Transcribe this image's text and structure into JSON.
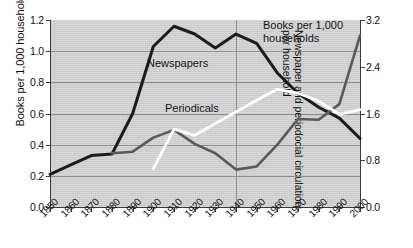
{
  "chart_data": {
    "type": "line",
    "title": "",
    "xlabel": "",
    "ylabel": "Books per 1,000 households",
    "y2label": "Newspaper and periodocial circulation per household",
    "x": [
      1850,
      1860,
      1870,
      1880,
      1890,
      1900,
      1910,
      1920,
      1930,
      1940,
      1950,
      1960,
      1970,
      1980,
      1990,
      2000
    ],
    "xtick_labels": [
      "1850",
      "1860",
      "1870",
      "1880",
      "1890",
      "1900",
      "1910",
      "1920",
      "1930",
      "1940",
      "1950",
      "1960",
      "1970",
      "1980",
      "1990",
      "2000"
    ],
    "ylim": [
      0.0,
      1.2
    ],
    "yticks": [
      0.0,
      0.2,
      0.4,
      0.6,
      0.8,
      1.0,
      1.2
    ],
    "ytick_labels": [
      "0.0",
      "0.2",
      "0.4",
      "0.6",
      "0.8",
      "1.0",
      "1.2"
    ],
    "y2lim": [
      0.0,
      3.2
    ],
    "y2ticks": [
      0.0,
      0.8,
      1.6,
      2.4,
      3.2
    ],
    "y2tick_labels": [
      "0.0",
      "0.8",
      "1.6",
      "2.4",
      "3.2"
    ],
    "grid": true,
    "grid_axis": "both",
    "legend_position": "inline-annotations",
    "plot_background": "#d4d4d4",
    "series": [
      {
        "name": "Newspapers",
        "axis": "right",
        "color": "#1b1b1b",
        "label_text": "Newspapers",
        "x": [
          1850,
          1860,
          1870,
          1880,
          1890,
          1900,
          1910,
          1920,
          1930,
          1940,
          1950,
          1960,
          1970,
          1980,
          1990,
          2000
        ],
        "values_right_axis": [
          0.56,
          0.72,
          0.88,
          0.91,
          1.6,
          2.75,
          3.09,
          2.95,
          2.72,
          2.96,
          2.79,
          2.29,
          1.95,
          1.71,
          1.52,
          1.17
        ],
        "values_left_scale": [
          0.21,
          0.27,
          0.33,
          0.34,
          0.6,
          1.03,
          1.16,
          1.11,
          1.02,
          1.11,
          1.05,
          0.86,
          0.73,
          0.64,
          0.57,
          0.44
        ]
      },
      {
        "name": "Books per 1,000 households",
        "axis": "left",
        "color": "#595959",
        "label_text": "Books per 1,000 households",
        "x": [
          1880,
          1890,
          1900,
          1910,
          1920,
          1930,
          1940,
          1950,
          1960,
          1970,
          1980,
          1990,
          2000
        ],
        "values": [
          0.345,
          0.355,
          0.445,
          0.495,
          0.405,
          0.345,
          0.24,
          0.26,
          0.4,
          0.565,
          0.56,
          0.66,
          1.1
        ]
      },
      {
        "name": "Periodicals",
        "axis": "right",
        "color": "#ffffff",
        "label_text": "Periodicals",
        "x": [
          1900,
          1910,
          1920,
          1930,
          1940,
          1950,
          1960,
          1970,
          1980,
          1990,
          2000
        ],
        "values_right_axis": [
          0.66,
          1.33,
          1.23,
          1.43,
          1.63,
          1.83,
          2.01,
          1.95,
          1.81,
          1.59,
          1.67
        ],
        "values_left_scale": [
          0.245,
          0.5,
          0.46,
          0.535,
          0.61,
          0.685,
          0.755,
          0.73,
          0.68,
          0.595,
          0.625
        ]
      }
    ],
    "annotations": [
      {
        "name": "newspapers-label",
        "text": "Newspapers"
      },
      {
        "name": "periodicals-label",
        "text": "Periodicals"
      },
      {
        "name": "books-label",
        "line1": "Books per 1,000",
        "line2": "households"
      }
    ]
  },
  "axes": {
    "left_title": "Books per 1,000 households",
    "right_title_line1": "Newspaper and periodocial circulation",
    "right_title_line2": "per household"
  }
}
